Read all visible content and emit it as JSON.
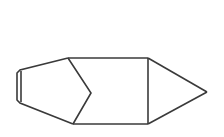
{
  "document": {
    "title": "Line Drawing",
    "background_color": "#ffffff",
    "width": 224,
    "height": 137
  },
  "drawing": {
    "name": "pencil-rocket-outline",
    "description": "Monochrome line drawing of an elongated pencil-like figure pointing right",
    "stroke_color": "#3a3a3a",
    "fill_color": "none",
    "stroke_width": 1.6,
    "viewbox": "0 0 224 137",
    "shapes": [
      {
        "name": "tail-outer-contour",
        "type": "polyline",
        "points": "68,58 20,70 17,73 17,100 20,103 73,124"
      },
      {
        "name": "tail-inner-line",
        "type": "polyline",
        "points": "21,71 21,102"
      },
      {
        "name": "body-top-edge",
        "type": "polyline",
        "points": "68,58 148,58"
      },
      {
        "name": "body-bottom-edge",
        "type": "polyline",
        "points": "73,124 148,124"
      },
      {
        "name": "chevron-divider",
        "type": "polyline",
        "points": "68,58 91,93 73,124"
      },
      {
        "name": "tip-divider-vertical",
        "type": "polyline",
        "points": "148,58 148,124"
      },
      {
        "name": "tip-upper-edge",
        "type": "polyline",
        "points": "148,58 207,92"
      },
      {
        "name": "tip-lower-edge",
        "type": "polyline",
        "points": "148,124 207,92"
      }
    ]
  }
}
